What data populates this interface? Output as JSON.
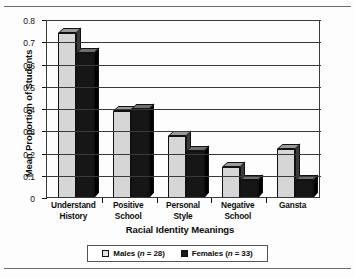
{
  "chart_data": {
    "type": "bar",
    "title": "",
    "xlabel": "Racial Identity Meanings",
    "ylabel": "Mean Proportion of Students",
    "categories": [
      "Understand History",
      "Positive School",
      "Personal Style",
      "Negative School",
      "Gansta"
    ],
    "category_lines": [
      [
        "Understand",
        "History"
      ],
      [
        "Positive",
        "School"
      ],
      [
        "Personal",
        "Style"
      ],
      [
        "Negative",
        "School"
      ],
      [
        "Gansta",
        ""
      ]
    ],
    "series": [
      {
        "name": "Males",
        "n": 28,
        "values": [
          0.74,
          0.39,
          0.28,
          0.14,
          0.22
        ],
        "color": "#d6d6d6"
      },
      {
        "name": "Females",
        "n": 33,
        "values": [
          0.65,
          0.4,
          0.21,
          0.08,
          0.08
        ],
        "color": "#161616"
      }
    ],
    "ylim": [
      0,
      0.8
    ],
    "ytick_labels": [
      "0.8",
      "0.7",
      "0.6",
      "0.5",
      "0.4",
      "0.3",
      "0.2",
      "0.1",
      "0"
    ],
    "ytick_values": [
      0.8,
      0.7,
      0.6,
      0.5,
      0.4,
      0.3,
      0.2,
      0.1,
      0
    ],
    "grid": true,
    "grid_axis": "y",
    "legend_position": "bottom",
    "style": "3d-grouped-bar-grayscale"
  },
  "legend": {
    "items": [
      {
        "label": "Males",
        "stat_prefix": "(",
        "stat_var": "n",
        "stat_value": " = 28)",
        "full": "Males (n = 28)"
      },
      {
        "label": "Females",
        "stat_prefix": "(",
        "stat_var": "n",
        "stat_value": " = 33)",
        "full": "Females (n = 33)"
      }
    ]
  }
}
